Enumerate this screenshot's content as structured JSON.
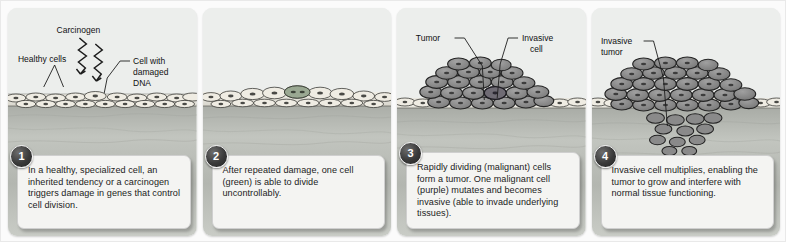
{
  "figure": {
    "background_color": "#fbfbfb",
    "panel_background": "#eceeec"
  },
  "colors": {
    "epithelium": "#e8e6de",
    "stroma": "#b9bcb6",
    "tumor_cell": "#8e8e8e",
    "invasive_cell": "#6f6b74",
    "green_cell": "#9aa892",
    "outline": "#2b2b2b",
    "label_text": "#111111",
    "badge": "#2d2d2d"
  },
  "panels": [
    {
      "number": "1",
      "caption": "In a healthy, specialized cell, an inherited tendency or a carcinogen triggers damage in genes that control cell division.",
      "labels": [
        {
          "name": "carcinogen",
          "text": "Carcinogen"
        },
        {
          "name": "healthy-cells",
          "text": "Healthy cells"
        },
        {
          "name": "damaged-dna",
          "text": "Cell with\ndamaged\nDNA"
        }
      ],
      "label_lines": [
        {
          "name": "cell-with-damaged-dna",
          "line1": "Cell with",
          "line2": "damaged",
          "line3": "DNA"
        }
      ],
      "icons": [
        "carcinogen-arrow-icon",
        "carcinogen-arrow-icon"
      ]
    },
    {
      "number": "2",
      "caption": "After repeated damage, one cell (green) is able to divide uncontrollably.",
      "labels": [],
      "label_lines": [],
      "icons": []
    },
    {
      "number": "3",
      "caption": "Rapidly dividing (malignant) cells form a tumor. One malignant cell (purple) mutates and becomes invasive (able to invade underlying tissues).",
      "labels": [
        {
          "name": "tumor",
          "text": "Tumor"
        },
        {
          "name": "invasive-cell",
          "text": "Invasive\ncell"
        }
      ],
      "label_lines": [
        {
          "name": "invasive-cell",
          "line1": "Invasive",
          "line2": "cell"
        }
      ],
      "icons": []
    },
    {
      "number": "4",
      "caption": "Invasive cell multiplies, enabling the tumor to grow and interfere with normal tissue functioning.",
      "labels": [
        {
          "name": "invasive-tumor",
          "text": "Invasive\ntumor"
        }
      ],
      "label_lines": [
        {
          "name": "invasive-tumor",
          "line1": "Invasive",
          "line2": "tumor"
        }
      ],
      "icons": []
    }
  ]
}
